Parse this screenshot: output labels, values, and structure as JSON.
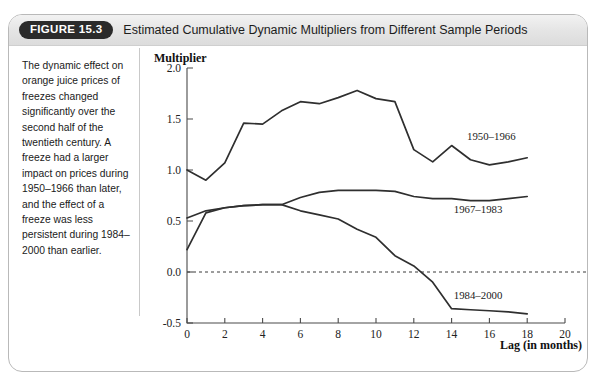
{
  "figure": {
    "badge": "FIGURE 15.3",
    "title": "Estimated Cumulative Dynamic Multipliers from Different Sample Periods",
    "caption": "The dynamic effect on orange juice prices of freezes changed significantly over the second half of the twentieth century. A freeze had a larger impact on prices during 1950–1966 than later, and the effect of a freeze was less persistent during 1984–2000 than earlier."
  },
  "colors": {
    "line": "#2f2f2f",
    "axis": "#4a4a4a",
    "panel_border": "#b9b9b9",
    "header_bg": "#e4e4e4",
    "badge_bg": "#2b2b2b"
  },
  "chart_data": {
    "type": "line",
    "title": "Estimated Cumulative Dynamic Multipliers from Different Sample Periods",
    "xlabel": "Lag (in months)",
    "ylabel": "Multiplier",
    "xlim": [
      0,
      20
    ],
    "ylim": [
      -0.5,
      2.0
    ],
    "xticks": [
      0,
      2,
      4,
      6,
      8,
      10,
      12,
      14,
      16,
      18,
      20
    ],
    "xticklabels": [
      "0",
      "2",
      "4",
      "6",
      "8",
      "10",
      "12",
      "14",
      "16",
      "18",
      "20"
    ],
    "yticks": [
      -0.5,
      0.0,
      0.5,
      1.0,
      1.5,
      2.0
    ],
    "yticklabels": [
      "-0.5",
      "0.0",
      "0.5",
      "1.0",
      "1.5",
      "2.0"
    ],
    "grid": false,
    "legend_position": "inline-right",
    "annotations": [
      {
        "text": "1950–1966",
        "x": 16.1,
        "y": 1.29
      },
      {
        "text": "1967–1983",
        "x": 15.4,
        "y": 0.58
      },
      {
        "text": "1984–2000",
        "x": 15.4,
        "y": -0.26
      }
    ],
    "reference_lines": [
      {
        "y": 0.0,
        "style": "dashed"
      }
    ],
    "x": [
      0,
      1,
      2,
      3,
      4,
      5,
      6,
      7,
      8,
      9,
      10,
      11,
      12,
      13,
      14,
      15,
      16,
      17,
      18
    ],
    "series": [
      {
        "name": "1950–1966",
        "values": [
          1.0,
          0.9,
          1.07,
          1.46,
          1.45,
          1.58,
          1.67,
          1.65,
          1.71,
          1.78,
          1.7,
          1.67,
          1.2,
          1.08,
          1.24,
          1.1,
          1.05,
          1.08,
          1.12
        ]
      },
      {
        "name": "1967–1983",
        "values": [
          0.53,
          0.6,
          0.63,
          0.65,
          0.66,
          0.66,
          0.73,
          0.78,
          0.8,
          0.8,
          0.8,
          0.79,
          0.74,
          0.72,
          0.72,
          0.7,
          0.7,
          0.72,
          0.74
        ]
      },
      {
        "name": "1984–2000",
        "values": [
          0.22,
          0.58,
          0.63,
          0.65,
          0.66,
          0.66,
          0.6,
          0.56,
          0.52,
          0.42,
          0.34,
          0.16,
          0.06,
          -0.1,
          -0.36,
          -0.37,
          -0.38,
          -0.39,
          -0.41
        ]
      }
    ]
  }
}
